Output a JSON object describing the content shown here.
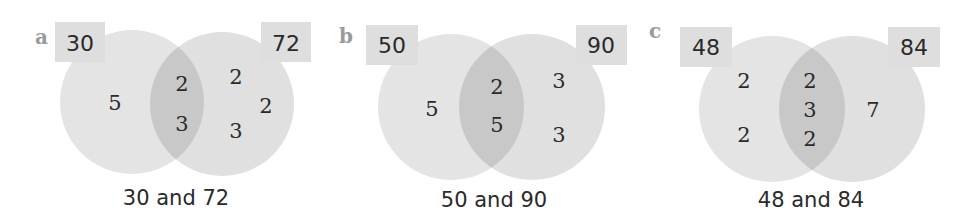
{
  "colors": {
    "circle_fill": "#e3e3e3",
    "overlap_fill": "#c9c9c9",
    "label_box_fill": "#dedede",
    "text": "#2a2a2a",
    "panel_letter": "#9a9a9a"
  },
  "panels": [
    {
      "letter": "a",
      "left_number": "30",
      "right_number": "72",
      "left_only": [
        "5"
      ],
      "common": [
        "2",
        "3"
      ],
      "right_only": [
        "2",
        "2",
        "3"
      ],
      "caption": "30 and 72"
    },
    {
      "letter": "b",
      "left_number": "50",
      "right_number": "90",
      "left_only": [
        "5"
      ],
      "common": [
        "2",
        "5"
      ],
      "right_only": [
        "3",
        "3"
      ],
      "caption": "50 and 90"
    },
    {
      "letter": "c",
      "left_number": "48",
      "right_number": "84",
      "left_only": [
        "2",
        "2"
      ],
      "common": [
        "2",
        "3",
        "2"
      ],
      "right_only": [
        "7"
      ],
      "caption": "48 and 84"
    }
  ]
}
